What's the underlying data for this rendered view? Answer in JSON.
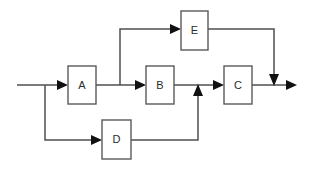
{
  "diagram": {
    "canvas": {
      "width": 312,
      "height": 169,
      "background": "#ffffff"
    },
    "colors": {
      "block_stroke": "#5a5a5a",
      "block_fill": "#ffffff",
      "wire": "#4f4f4f",
      "arrow": "#111111",
      "label": "#2b2b2b"
    },
    "blocks": [
      {
        "id": "A",
        "label": "A",
        "x": 68,
        "y": 66,
        "width": 28,
        "height": 38
      },
      {
        "id": "B",
        "label": "B",
        "x": 146,
        "y": 66,
        "width": 28,
        "height": 38
      },
      {
        "id": "C",
        "label": "C",
        "x": 224,
        "y": 66,
        "width": 28,
        "height": 38
      },
      {
        "id": "D",
        "label": "D",
        "x": 102,
        "y": 120,
        "width": 29,
        "height": 39
      },
      {
        "id": "E",
        "label": "E",
        "x": 181,
        "y": 11,
        "width": 27,
        "height": 39
      }
    ],
    "connections": [
      {
        "id": "input-to-A",
        "from": "input",
        "to": "A",
        "arrow": "right"
      },
      {
        "id": "A-to-B",
        "from": "A",
        "to": "B",
        "arrow": "right"
      },
      {
        "id": "A-to-E",
        "from": "A",
        "to": "E",
        "arrow": "right"
      },
      {
        "id": "E-to-output",
        "from": "E",
        "to": "output-node",
        "arrow": "down"
      },
      {
        "id": "input-to-D",
        "from": "input",
        "to": "D",
        "arrow": "right"
      },
      {
        "id": "D-to-BC",
        "from": "D",
        "to": "B-C-line",
        "arrow": "up"
      },
      {
        "id": "B-to-C",
        "from": "B",
        "to": "C",
        "arrow": "right"
      },
      {
        "id": "C-to-output",
        "from": "C",
        "to": "output",
        "arrow": "right"
      }
    ],
    "ports": {
      "input_line_y": 85,
      "input_line_start_x": 17,
      "output_line_end_x": 295,
      "top_branch_y": 29,
      "top_branch_x": 120,
      "e_return_x": 274,
      "bottom_branch_x": 45,
      "bottom_branch_y": 140,
      "d_return_x": 198
    }
  }
}
